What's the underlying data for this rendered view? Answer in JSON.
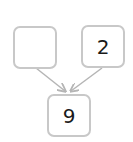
{
  "diagram": {
    "type": "number-bond",
    "parts": [
      {
        "id": "left",
        "value": ""
      },
      {
        "id": "right",
        "value": "2"
      }
    ],
    "whole": {
      "id": "bottom",
      "value": "9"
    },
    "colors": {
      "border": "#c8c8c8",
      "arrow": "#b5b5b5",
      "text": "#1a1a1a"
    }
  }
}
